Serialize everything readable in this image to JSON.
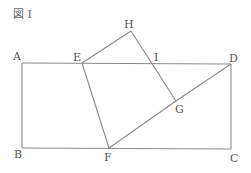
{
  "figure": {
    "title": "図 I",
    "line_color": "#8a8a8a",
    "label_color": "#555555"
  },
  "points": {
    "A": {
      "label": "A",
      "x": 22,
      "y": 63
    },
    "B": {
      "label": "B",
      "x": 22,
      "y": 148
    },
    "C": {
      "label": "C",
      "x": 231,
      "y": 149
    },
    "D": {
      "label": "D",
      "x": 231,
      "y": 64
    },
    "E": {
      "label": "E",
      "x": 82,
      "y": 63
    },
    "F": {
      "label": "F",
      "x": 109,
      "y": 148
    },
    "G": {
      "label": "G",
      "x": 176,
      "y": 101
    },
    "H": {
      "label": "H",
      "x": 131,
      "y": 31
    },
    "I": {
      "label": "I",
      "x": 153,
      "y": 63
    }
  },
  "segments": [
    [
      "A",
      "D"
    ],
    [
      "A",
      "B"
    ],
    [
      "B",
      "C"
    ],
    [
      "C",
      "D"
    ],
    [
      "E",
      "H"
    ],
    [
      "H",
      "G"
    ],
    [
      "E",
      "F"
    ],
    [
      "F",
      "G"
    ],
    [
      "F",
      "D"
    ]
  ]
}
